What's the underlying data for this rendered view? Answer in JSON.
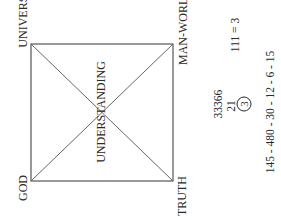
{
  "diagram": {
    "square": {
      "corners": {
        "top_left": [
          31,
          44
        ],
        "top_right": [
          173,
          44
        ],
        "bottom_right": [
          173,
          181
        ],
        "bottom_left": [
          31,
          181
        ]
      },
      "stroke_color": "#555555",
      "diagonals": true
    },
    "labels": {
      "universe": "UNIVERSE",
      "god": "GOD",
      "man_world": "MAN-WORLD",
      "truth": "TRUTH",
      "understanding": "UNDERSTANDING"
    },
    "numbers": {
      "sum_top": "33366",
      "sum_middle": "21",
      "sum_result": "3",
      "equation": "111 = 3",
      "sequence": "145 - 480 - 30 - 12 - 6 - 15"
    },
    "orientation": "text rotated -90 degrees"
  }
}
